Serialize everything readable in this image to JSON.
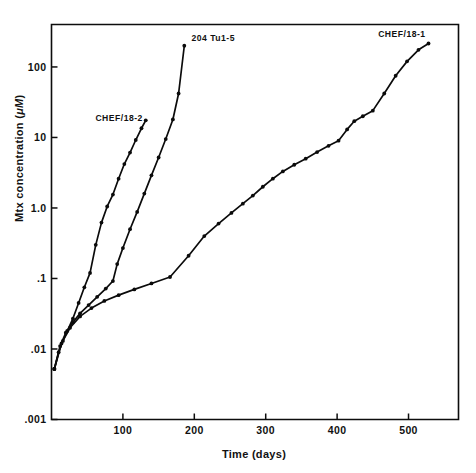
{
  "figure": {
    "background_color": "#ffffff",
    "ink_color": "#0b0b0b"
  },
  "chart_data": {
    "type": "line",
    "title": "",
    "xlabel": "Time (days)",
    "ylabel": "Mtx concentration (μM)",
    "ylabel_parts": {
      "main": "Mtx concentration (",
      "italic_mu_m": "μM",
      "close": ")"
    },
    "xscale": "linear",
    "yscale": "log",
    "xlim": [
      0,
      570
    ],
    "ylim": [
      0.001,
      400
    ],
    "grid": false,
    "legend": "inline-series-labels",
    "xticks": [
      100,
      200,
      300,
      400,
      500
    ],
    "xticklabels": [
      "100",
      "200",
      "300",
      "400",
      "500"
    ],
    "yticks": [
      100,
      10,
      1.0,
      0.1,
      0.01,
      0.001
    ],
    "yticklabels": [
      "100",
      "10",
      "1.0",
      ".1",
      ".01",
      ".001"
    ],
    "series": [
      {
        "name": "CHEF/18-2",
        "label": "CHEF/18-2",
        "label_anchor": "end",
        "label_x": 128,
        "label_y": 17,
        "marker": "filled-circle",
        "x": [
          4,
          10,
          16,
          22,
          30,
          38,
          46,
          54,
          62,
          70,
          78,
          86,
          94,
          102,
          110,
          118,
          126,
          132
        ],
        "y": [
          0.0052,
          0.009,
          0.013,
          0.018,
          0.027,
          0.045,
          0.075,
          0.12,
          0.3,
          0.62,
          1.05,
          1.55,
          2.6,
          4.2,
          6.1,
          9.2,
          13.5,
          17.5
        ]
      },
      {
        "name": "204 Tu1-5",
        "label": "204 Tu1-5",
        "label_anchor": "start",
        "label_x": 196,
        "label_y": 230,
        "marker": "filled-circle",
        "x": [
          4,
          12,
          20,
          30,
          40,
          52,
          64,
          76,
          86,
          92,
          100,
          110,
          120,
          130,
          140,
          150,
          160,
          170,
          178,
          186
        ],
        "y": [
          0.0052,
          0.011,
          0.017,
          0.024,
          0.032,
          0.042,
          0.055,
          0.072,
          0.092,
          0.16,
          0.27,
          0.5,
          0.88,
          1.6,
          2.9,
          5.2,
          9.5,
          18.0,
          42.0,
          200.0
        ]
      },
      {
        "name": "CHEF/18-1",
        "label": "CHEF/18-1",
        "label_anchor": "end",
        "label_x": 524,
        "label_y": 270,
        "marker": "filled-circle",
        "x": [
          4,
          14,
          26,
          40,
          56,
          74,
          94,
          116,
          140,
          166,
          192,
          214,
          234,
          252,
          268,
          282,
          296,
          310,
          324,
          340,
          356,
          372,
          388,
          402,
          414,
          424,
          436,
          450,
          466,
          482,
          498,
          514,
          528
        ],
        "y": [
          0.0052,
          0.012,
          0.02,
          0.029,
          0.038,
          0.048,
          0.058,
          0.07,
          0.085,
          0.105,
          0.21,
          0.4,
          0.6,
          0.85,
          1.15,
          1.5,
          2.0,
          2.6,
          3.3,
          4.1,
          5.0,
          6.2,
          7.6,
          9.0,
          13.0,
          17.0,
          20.0,
          24.0,
          42.0,
          75.0,
          120.0,
          175.0,
          215.0
        ]
      }
    ]
  }
}
